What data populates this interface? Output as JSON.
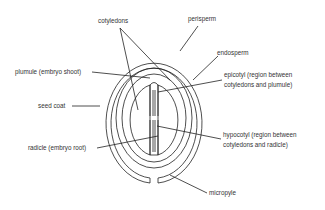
{
  "diagram": {
    "line_color": "#222222",
    "text_color": "#333333",
    "labels": {
      "cotyledons": "cotyledons",
      "perisperm": "perisperm",
      "endosperm": "endosperm",
      "epicotyl_1": "epicotyl (region between",
      "epicotyl_2": "cotyledons and plumule)",
      "plumule": "plumule (embryo shoot)",
      "seed_coat": "seed coat",
      "hypocotyl_1": "hypocotyl (region between",
      "hypocotyl_2": "cotyledons and radicle)",
      "radicle": "radicle (embryo root)",
      "micropyle": "micropyle"
    }
  }
}
